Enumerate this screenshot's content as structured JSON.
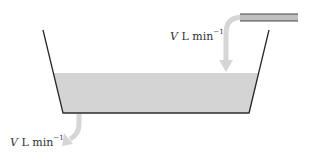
{
  "diagram": {
    "type": "tank-flow",
    "colors": {
      "wall": "#2a2a2a",
      "water": "#d4d4d4",
      "arrow": "#d6d6d6",
      "pipe_fill": "#bfbfbf",
      "pipe_line": "#444444",
      "text": "#333333"
    },
    "inflow_label": {
      "var": "V",
      "unit": "L min",
      "exp": "−1"
    },
    "outflow_label": {
      "var": "V",
      "unit": "L min",
      "exp": "−1"
    }
  }
}
